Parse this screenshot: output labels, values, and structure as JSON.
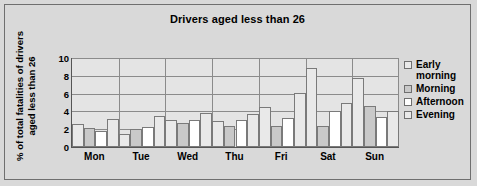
{
  "chart_data": {
    "type": "bar",
    "title": "Drivers aged less than 26",
    "xlabel": "",
    "ylabel_lines": [
      "% of total fatalities of drivers",
      "aged less than 26"
    ],
    "ylabel": "% of total fatalities of drivers aged less than 26",
    "categories": [
      "Mon",
      "Tue",
      "Wed",
      "Thu",
      "Fri",
      "Sat",
      "Sun"
    ],
    "ylim": [
      0,
      10
    ],
    "yticks": [
      10,
      8,
      6,
      4,
      2,
      0
    ],
    "grid": true,
    "legend_position": "right",
    "series": [
      {
        "name": "Early morning",
        "name_lines": [
          "Early",
          "morning"
        ],
        "color": "#e9e9e9",
        "values": [
          2.6,
          1.5,
          3.0,
          2.9,
          4.5,
          8.9,
          7.8
        ]
      },
      {
        "name": "Morning",
        "name_lines": [
          "Morning"
        ],
        "color": "#c9c9c9",
        "values": [
          2.1,
          2.0,
          2.7,
          2.4,
          2.4,
          2.4,
          4.6
        ]
      },
      {
        "name": "Afternoon",
        "name_lines": [
          "Afternoon"
        ],
        "color": "#ffffff",
        "values": [
          1.8,
          2.3,
          3.0,
          3.0,
          3.3,
          4.0,
          3.4
        ]
      },
      {
        "name": "Evening",
        "name_lines": [
          "Evening"
        ],
        "color": "#e9e9e9",
        "values": [
          3.2,
          3.5,
          3.8,
          3.7,
          6.1,
          4.9,
          4.1
        ]
      }
    ]
  }
}
